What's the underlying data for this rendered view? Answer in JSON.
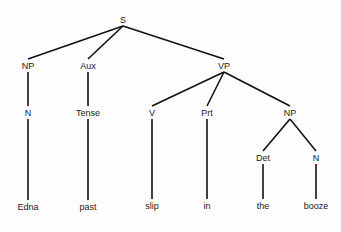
{
  "tree": {
    "nodes": [
      {
        "id": "S",
        "label": "S",
        "x": 123,
        "y": 20
      },
      {
        "id": "NP1",
        "label": "NP",
        "x": 28,
        "y": 66
      },
      {
        "id": "Aux",
        "label": "Aux",
        "x": 88,
        "y": 66
      },
      {
        "id": "VP",
        "label": "VP",
        "x": 224,
        "y": 66
      },
      {
        "id": "N1",
        "label": "N",
        "x": 28,
        "y": 113
      },
      {
        "id": "Tense",
        "label": "Tense",
        "x": 88,
        "y": 113
      },
      {
        "id": "V",
        "label": "V",
        "x": 152,
        "y": 113
      },
      {
        "id": "Prt",
        "label": "Prt",
        "x": 207,
        "y": 113
      },
      {
        "id": "NP2",
        "label": "NP",
        "x": 290,
        "y": 113
      },
      {
        "id": "Det",
        "label": "Det",
        "x": 263,
        "y": 158
      },
      {
        "id": "N2",
        "label": "N",
        "x": 316,
        "y": 158
      },
      {
        "id": "Edna",
        "label": "Edna",
        "x": 28,
        "y": 207
      },
      {
        "id": "past",
        "label": "past",
        "x": 88,
        "y": 207
      },
      {
        "id": "slip",
        "label": "slip",
        "x": 152,
        "y": 206
      },
      {
        "id": "in",
        "label": "in",
        "x": 207,
        "y": 206
      },
      {
        "id": "the",
        "label": "the",
        "x": 263,
        "y": 206
      },
      {
        "id": "booze",
        "label": "booze",
        "x": 316,
        "y": 206
      }
    ],
    "edges": [
      [
        "S",
        "NP1"
      ],
      [
        "S",
        "Aux"
      ],
      [
        "S",
        "VP"
      ],
      [
        "NP1",
        "N1"
      ],
      [
        "Aux",
        "Tense"
      ],
      [
        "VP",
        "V"
      ],
      [
        "VP",
        "Prt"
      ],
      [
        "VP",
        "NP2"
      ],
      [
        "N1",
        "Edna"
      ],
      [
        "Tense",
        "past"
      ],
      [
        "V",
        "slip"
      ],
      [
        "Prt",
        "in"
      ],
      [
        "NP2",
        "Det"
      ],
      [
        "NP2",
        "N2"
      ],
      [
        "Det",
        "the"
      ],
      [
        "N2",
        "booze"
      ]
    ]
  }
}
